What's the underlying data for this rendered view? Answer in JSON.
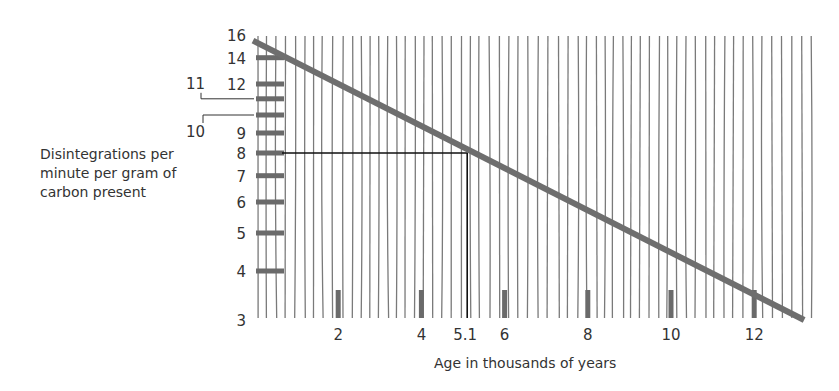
{
  "chart_data": {
    "type": "line",
    "title": "",
    "xlabel": "Age in thousands of years",
    "ylabel": "Disintegrations per minute per gram of carbon present",
    "y_scale": "log",
    "x_ticks": [
      2,
      4,
      5.1,
      6,
      8,
      10,
      12
    ],
    "y_ticks": [
      3,
      4,
      5,
      6,
      7,
      8,
      9,
      10,
      11,
      12,
      14,
      16
    ],
    "xlim": [
      0,
      13.2
    ],
    "ylim": [
      3,
      16
    ],
    "series": [
      {
        "name": "Carbon-14 decay",
        "x": [
          0,
          2,
          4,
          5.1,
          6,
          8,
          10,
          12,
          13.2
        ],
        "y": [
          15.3,
          12.6,
          9.8,
          8,
          7.3,
          5.6,
          4.3,
          3.5,
          3.0
        ],
        "color": "#6e6e6e"
      }
    ],
    "annotations": [
      {
        "type": "reference-line",
        "from_y": 8,
        "to_x": 5.1,
        "text": "8 → 5.1"
      }
    ],
    "grid": "vertical hatch lines",
    "legend": "none"
  },
  "labels": {
    "y_axis_title_lines": [
      "Disintegrations per",
      "minute per gram of",
      "carbon present"
    ],
    "x_axis_title": "Age in thousands of years",
    "y_tick_labels": [
      "16",
      "14",
      "12",
      "11",
      "10",
      "9",
      "8",
      "7",
      "6",
      "5",
      "4",
      "3"
    ],
    "x_tick_labels": [
      "2",
      "4",
      "5.1",
      "6",
      "8",
      "10",
      "12"
    ]
  }
}
